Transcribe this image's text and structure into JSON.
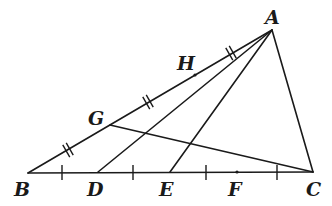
{
  "diagram": {
    "type": "geometry-triangle",
    "points": {
      "A": {
        "label": "A",
        "x": 272,
        "y": 30,
        "lx": 265,
        "ly": 24
      },
      "B": {
        "label": "B",
        "x": 28,
        "y": 173,
        "lx": 14,
        "ly": 196
      },
      "C": {
        "label": "C",
        "x": 313,
        "y": 172,
        "lx": 306,
        "ly": 196
      },
      "D": {
        "label": "D",
        "x": 98,
        "y": 172,
        "lx": 87,
        "ly": 196
      },
      "E": {
        "label": "E",
        "x": 170,
        "y": 172,
        "lx": 159,
        "ly": 196
      },
      "F": {
        "label": "F",
        "x": 237,
        "y": 172,
        "lx": 228,
        "ly": 196
      },
      "G": {
        "label": "G",
        "x": 110,
        "y": 125,
        "lx": 88,
        "ly": 125
      },
      "H": {
        "label": "H",
        "x": 195,
        "y": 75,
        "lx": 177,
        "ly": 70
      }
    },
    "segments": [
      "AB",
      "BC",
      "CA",
      "AD",
      "AE",
      "GC"
    ],
    "equal_marks": {
      "BC_single_ticks": [
        "BD",
        "DE",
        "EF",
        "FC"
      ],
      "AB_double_ticks": [
        "BG",
        "GH",
        "HA"
      ]
    }
  }
}
